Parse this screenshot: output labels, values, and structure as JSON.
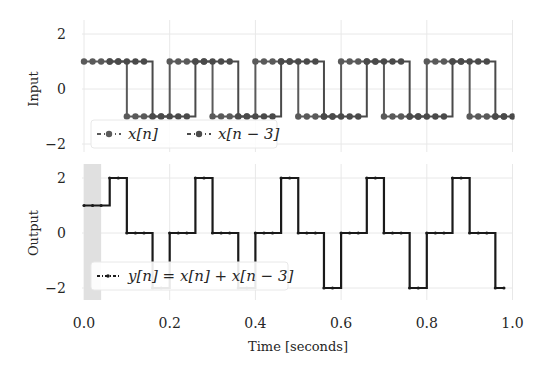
{
  "figure": {
    "xlabel": "Time [seconds]",
    "panels": [
      {
        "ylabel": "Input",
        "legend": [
          "x[n]",
          "x[n − 3]"
        ]
      },
      {
        "ylabel": "Output",
        "legend": [
          "y[n] = x[n] + x[n − 3]"
        ]
      }
    ],
    "xticks": [
      "0.0",
      "0.2",
      "0.4",
      "0.6",
      "0.8",
      "1.0"
    ],
    "yticks": [
      "2",
      "0",
      "−2"
    ],
    "colors": {
      "x": "#5a5a5a",
      "xdelay": "#4a4a4a",
      "y": "#1a1a1a",
      "grid": "#e6e6e6",
      "span": "#e0e0e0"
    }
  },
  "chart_data": [
    {
      "type": "line",
      "title": "",
      "xlabel": "",
      "ylabel": "Input",
      "xlim": [
        0,
        1
      ],
      "ylim": [
        -2.5,
        2.5
      ],
      "grid": true,
      "legend_position": "lower left",
      "drawstyle": "steps-post",
      "sample_spacing": 0.02,
      "series": [
        {
          "name": "x[n]",
          "x_start": 0.0,
          "x_step": 0.02,
          "values": [
            1,
            1,
            1,
            1,
            1,
            -1,
            -1,
            -1,
            -1,
            -1,
            1,
            1,
            1,
            1,
            1,
            -1,
            -1,
            -1,
            -1,
            -1,
            1,
            1,
            1,
            1,
            1,
            -1,
            -1,
            -1,
            -1,
            -1,
            1,
            1,
            1,
            1,
            1,
            -1,
            -1,
            -1,
            -1,
            -1,
            1,
            1,
            1,
            1,
            1,
            -1,
            -1,
            -1,
            -1,
            -1
          ]
        },
        {
          "name": "x[n − 3]",
          "x_start": 0.06,
          "x_step": 0.02,
          "values": [
            1,
            1,
            1,
            1,
            1,
            -1,
            -1,
            -1,
            -1,
            -1,
            1,
            1,
            1,
            1,
            1,
            -1,
            -1,
            -1,
            -1,
            -1,
            1,
            1,
            1,
            1,
            1,
            -1,
            -1,
            -1,
            -1,
            -1,
            1,
            1,
            1,
            1,
            1,
            -1,
            -1,
            -1,
            -1,
            -1,
            1,
            1,
            1,
            1,
            1,
            -1,
            -1,
            -1,
            -1,
            -1
          ]
        }
      ]
    },
    {
      "type": "line",
      "title": "",
      "xlabel": "Time [seconds]",
      "ylabel": "Output",
      "xlim": [
        0,
        1
      ],
      "ylim": [
        -2.5,
        2.5
      ],
      "grid": true,
      "legend_position": "lower left",
      "drawstyle": "steps-post",
      "shaded_span": [
        0.0,
        0.04
      ],
      "series": [
        {
          "name": "y[n] = x[n] + x[n − 3]",
          "x_start": 0.0,
          "x_step": 0.02,
          "values": [
            1,
            1,
            1,
            2,
            2,
            0,
            0,
            0,
            -2,
            -2,
            0,
            0,
            0,
            2,
            2,
            0,
            0,
            0,
            -2,
            -2,
            0,
            0,
            0,
            2,
            2,
            0,
            0,
            0,
            -2,
            -2,
            0,
            0,
            0,
            2,
            2,
            0,
            0,
            0,
            -2,
            -2,
            0,
            0,
            0,
            2,
            2,
            0,
            0,
            0,
            -2,
            -2
          ]
        }
      ]
    }
  ]
}
